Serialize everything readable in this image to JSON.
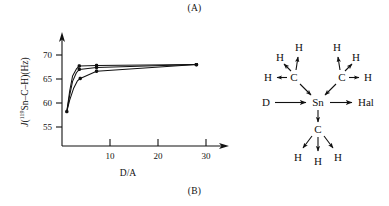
{
  "figure": {
    "panel_a_caption": "(A)",
    "panel_b_caption": "(B)"
  },
  "chart_data": {
    "type": "line",
    "title": "",
    "xlabel": "D/A",
    "ylabel": "J(119Sn–C–H)(Hz)",
    "ylabel_parts": {
      "symbol": "J",
      "open_paren": "(",
      "superscript": "119",
      "nucleus": "Sn–C–H",
      "close_paren": ")",
      "units": "(Hz)"
    },
    "xlim": [
      0,
      33
    ],
    "ylim": [
      52,
      73
    ],
    "xticks": [
      10,
      20,
      30
    ],
    "xtick_labels": [
      "10",
      "20",
      "30"
    ],
    "yticks": [
      55,
      60,
      65,
      70
    ],
    "ytick_labels": [
      "55",
      "60",
      "65",
      "70"
    ],
    "grid": false,
    "legend": "none",
    "marker": "filled-circle",
    "series": [
      {
        "name": "curve-1",
        "x": [
          1.0,
          1.6,
          2.2,
          3.0,
          3.6,
          7.2,
          28.0
        ],
        "y": [
          58.2,
          62.5,
          65.6,
          67.1,
          67.7,
          67.8,
          68.0
        ],
        "markers_at": [
          1.0,
          3.6,
          7.2,
          28.0
        ]
      },
      {
        "name": "curve-2",
        "x": [
          1.0,
          1.6,
          2.2,
          3.0,
          3.6,
          7.2,
          28.0
        ],
        "y": [
          58.2,
          61.6,
          64.5,
          66.3,
          67.0,
          67.4,
          68.0
        ],
        "markers_at": [
          3.6,
          7.2,
          28.0
        ]
      },
      {
        "name": "curve-3",
        "x": [
          1.0,
          1.6,
          2.4,
          3.2,
          3.8,
          7.2,
          28.0
        ],
        "y": [
          58.2,
          60.6,
          63.0,
          64.6,
          65.1,
          66.6,
          68.0
        ],
        "markers_at": [
          3.8,
          7.2,
          28.0
        ]
      }
    ]
  },
  "molecule": {
    "name": "trimethyltin-donor-halide-complex",
    "center_atom": "Sn",
    "left_ligand": "D",
    "right_ligand": "Hal",
    "carbon_label": "C",
    "hydrogen_label": "H",
    "groups": [
      {
        "name": "methyl-upper-left",
        "carbon": "C",
        "hydrogens": [
          "H",
          "H",
          "H"
        ]
      },
      {
        "name": "methyl-upper-right",
        "carbon": "C",
        "hydrogens": [
          "H",
          "H",
          "H"
        ]
      },
      {
        "name": "methyl-lower",
        "carbon": "C",
        "hydrogens": [
          "H",
          "H",
          "H"
        ]
      }
    ]
  },
  "colors": {
    "ink": "#111111",
    "background": "#ffffff"
  }
}
